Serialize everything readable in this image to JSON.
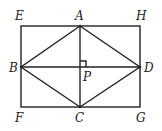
{
  "diagram": {
    "points": {
      "E": {
        "label": "E",
        "x": 21,
        "y": 26
      },
      "H": {
        "label": "H",
        "x": 140,
        "y": 26
      },
      "G": {
        "label": "G",
        "x": 140,
        "y": 107
      },
      "F": {
        "label": "F",
        "x": 21,
        "y": 107
      },
      "A": {
        "label": "A",
        "x": 80,
        "y": 26
      },
      "B": {
        "label": "B",
        "x": 21,
        "y": 67
      },
      "C": {
        "label": "C",
        "x": 80,
        "y": 107
      },
      "D": {
        "label": "D",
        "x": 140,
        "y": 67
      },
      "P": {
        "label": "P",
        "x": 80,
        "y": 67
      }
    },
    "segments": [
      "EH",
      "HG",
      "GF",
      "FE",
      "AB",
      "BC",
      "CD",
      "DA",
      "AC",
      "BD"
    ],
    "right_angle_at": "P",
    "line_color": "#222222"
  }
}
